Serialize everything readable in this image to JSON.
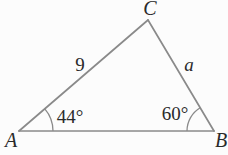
{
  "figure": {
    "type": "triangle",
    "background_color": "#fcfcfc",
    "line_color": "#8a8a8a",
    "text_color": "#2a2a2a",
    "vertices": {
      "A": {
        "label": "A"
      },
      "B": {
        "label": "B"
      },
      "C": {
        "label": "C"
      }
    },
    "sides": {
      "AC": {
        "label": "9"
      },
      "CB": {
        "label": "a"
      },
      "AB": {
        "label": ""
      }
    },
    "angles": {
      "A": {
        "label": "44°"
      },
      "B": {
        "label": "60°"
      }
    }
  }
}
